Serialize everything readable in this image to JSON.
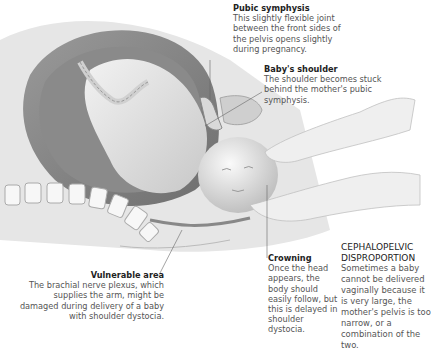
{
  "annotations": {
    "pubic_symphysis": {
      "title": "Pubic symphysis",
      "body": "This slightly flexible joint between the front sides of the pelvis opens slightly during pregnancy."
    },
    "babys_shoulder": {
      "title": "Baby's shoulder",
      "body": "The shoulder becomes stuck behind the mother's pubic symphysis."
    },
    "vulnerable_area": {
      "title": "Vulnerable area",
      "body": "The brachial nerve plexus, which supplies the arm, might be damaged during delivery of a baby with shoulder dystocia."
    },
    "crowning": {
      "title": "Crowning",
      "body": "Once the head appears, the body should easily follow, but this is delayed in shoulder dystocia."
    }
  },
  "sidebar": {
    "title": "CEPHALOPELVIC DISPROPORTION",
    "body": "Sometimes a baby cannot be delivered vaginally because it is very large, the mother's pelvis is too narrow, or a combination of the two."
  },
  "colors": {
    "title_text": "#222222",
    "body_text": "#555555",
    "illustration_gray": "#bdbdbd"
  }
}
